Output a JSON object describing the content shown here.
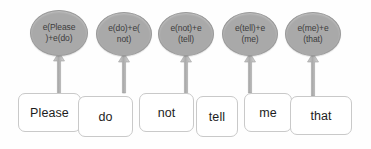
{
  "diagram": {
    "type": "node-arrow-diagram",
    "background_color": "#fefefe",
    "node_fill_color": "#a9a9a9",
    "node_text_color": "#3c3c3c",
    "box_border_color": "#c9c9c9",
    "box_fill_color": "#ffffff",
    "arrow_color": "#b4b4b4",
    "sentence": "Please do not tell me that"
  },
  "nodes": [
    {
      "id": "node-0",
      "label": "e(Please\n)+e(do)",
      "cx": 59,
      "cy": 33,
      "rx": 29,
      "ry": 23
    },
    {
      "id": "node-1",
      "label": "e(do)+e(\nnot)",
      "cx": 124,
      "cy": 34,
      "rx": 28,
      "ry": 22
    },
    {
      "id": "node-2",
      "label": "e(not)+e\n(tell)",
      "cx": 186,
      "cy": 34,
      "rx": 28,
      "ry": 22
    },
    {
      "id": "node-3",
      "label": "e(tell)+e\n(me)",
      "cx": 250,
      "cy": 34,
      "rx": 28,
      "ry": 22
    },
    {
      "id": "node-4",
      "label": "e(me)+e\n(that)",
      "cx": 313,
      "cy": 34,
      "rx": 28,
      "ry": 22
    }
  ],
  "arrows": [
    {
      "id": "arrow-0",
      "x": 59,
      "y_top": 52,
      "y_bottom": 96
    },
    {
      "id": "arrow-1",
      "x": 124,
      "y_top": 53,
      "y_bottom": 93
    },
    {
      "id": "arrow-2",
      "x": 186,
      "y_top": 53,
      "y_bottom": 96
    },
    {
      "id": "arrow-3",
      "x": 250,
      "y_top": 53,
      "y_bottom": 93
    },
    {
      "id": "arrow-4",
      "x": 313,
      "y_top": 53,
      "y_bottom": 96
    }
  ],
  "words": [
    {
      "id": "word-0",
      "label": "Please",
      "x": 18,
      "y": 93,
      "w": 63,
      "h": 39
    },
    {
      "id": "word-1",
      "label": "do",
      "x": 78,
      "y": 96,
      "w": 55,
      "h": 41
    },
    {
      "id": "word-2",
      "label": "not",
      "x": 139,
      "y": 93,
      "w": 55,
      "h": 39
    },
    {
      "id": "word-3",
      "label": "tell",
      "x": 196,
      "y": 96,
      "w": 42,
      "h": 41
    },
    {
      "id": "word-4",
      "label": "me",
      "x": 244,
      "y": 93,
      "w": 48,
      "h": 39
    },
    {
      "id": "word-5",
      "label": "that",
      "x": 290,
      "y": 96,
      "w": 62,
      "h": 39
    }
  ]
}
